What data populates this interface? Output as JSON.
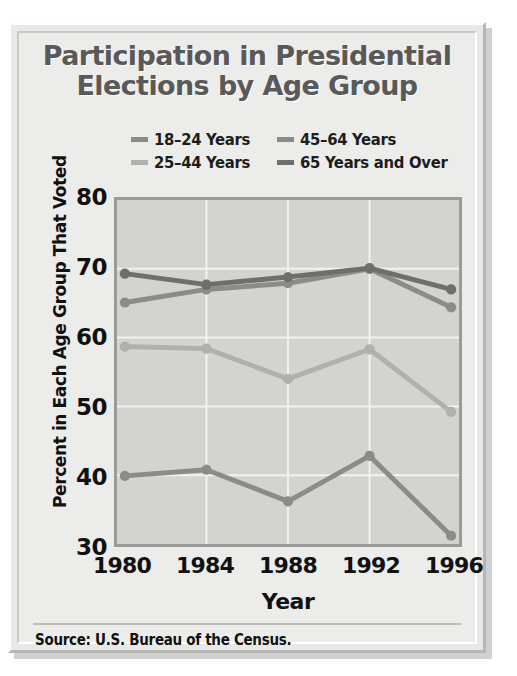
{
  "title": {
    "line1": "Participation in Presidential",
    "line2": "Elections by Age Group"
  },
  "source": "Source: U.S. Bureau of the Census.",
  "colors": {
    "age_18_24": "#8b8b89",
    "age_25_44": "#b0b0ae",
    "age_45_64": "#8b8b89",
    "age_65_plus": "#6e6e6c",
    "plot_background": "#d3d3d1",
    "panel_background": "#ececea",
    "grid": "#f2f2f0",
    "axis": "#9b9b99",
    "title_text": "#595959",
    "body_text": "#111111"
  },
  "chart_data": {
    "type": "line",
    "title": "Participation in Presidential Elections by Age Group",
    "xlabel": "Year",
    "ylabel": "Percent in Each Age Group That Voted",
    "categories": [
      "1980",
      "1984",
      "1988",
      "1992",
      "1996"
    ],
    "x": [
      1980,
      1984,
      1988,
      1992,
      1996
    ],
    "ylim": [
      30,
      80
    ],
    "xlim": [
      1980,
      1996
    ],
    "yticks": [
      30,
      40,
      50,
      60,
      70,
      80
    ],
    "grid": true,
    "legend_position": "top-center",
    "markers": true,
    "series": [
      {
        "name": "18–24 Years",
        "color": "#8b8b89",
        "values": [
          39.9,
          40.8,
          36.2,
          42.8,
          31.2
        ]
      },
      {
        "name": "25–44 Years",
        "color": "#b0b0ae",
        "values": [
          58.7,
          58.4,
          54.0,
          58.3,
          49.2
        ]
      },
      {
        "name": "45–64 Years",
        "color": "#8b8b89",
        "values": [
          65.1,
          67.0,
          67.9,
          70.0,
          64.4
        ]
      },
      {
        "name": "65 Years and Over",
        "color": "#6e6e6c",
        "values": [
          69.3,
          67.7,
          68.8,
          70.1,
          67.0
        ]
      }
    ]
  },
  "legend": {
    "items": [
      {
        "label": "18–24 Years",
        "color": "#8b8b89"
      },
      {
        "label": "45–64 Years",
        "color": "#8b8b89"
      },
      {
        "label": "25–44 Years",
        "color": "#b0b0ae"
      },
      {
        "label": "65 Years and Over",
        "color": "#6e6e6c"
      }
    ]
  },
  "axes": {
    "y_ticks": [
      "80",
      "70",
      "60",
      "50",
      "40",
      "30"
    ],
    "x_ticks": [
      "1980",
      "1984",
      "1988",
      "1992",
      "1996"
    ],
    "x_title": "Year",
    "y_title": "Percent in Each Age Group That Voted"
  }
}
